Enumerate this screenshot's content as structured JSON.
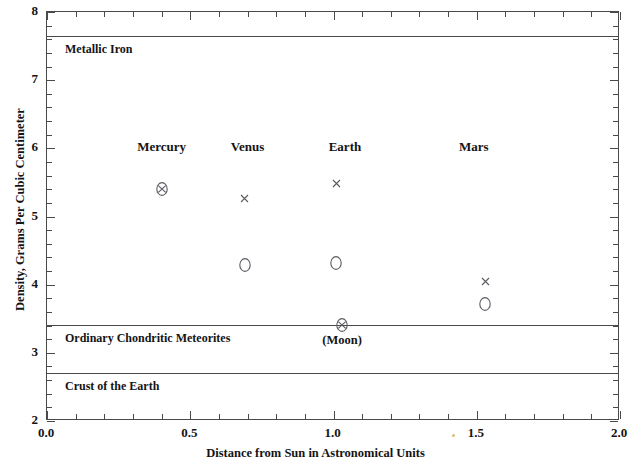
{
  "chart_data": {
    "type": "scatter",
    "title": "",
    "xlabel": "Distance from Sun in Astronomical Units",
    "ylabel": "Density, Grams Per Cubic Centimeter",
    "xlim": [
      0.0,
      2.0
    ],
    "ylim": [
      2,
      8
    ],
    "grid": false,
    "legend_position": "none",
    "x_ticks": [
      "0.0",
      "0.5",
      "1.0",
      "1.5",
      "2.0"
    ],
    "x_tick_values": [
      0.0,
      0.5,
      1.0,
      1.5,
      2.0
    ],
    "x_minor_step": 0.1,
    "y_ticks": [
      "2",
      "3",
      "4",
      "5",
      "6",
      "7",
      "8"
    ],
    "y_tick_values": [
      2,
      3,
      4,
      5,
      6,
      7,
      8
    ],
    "y_minor_step": 0.2,
    "series": [
      {
        "name": "Uncompressed density",
        "marker": "open-circle",
        "points": [
          {
            "label": "Venus",
            "x": 0.69,
            "y": 4.29
          },
          {
            "label": "Earth",
            "x": 1.01,
            "y": 4.32
          },
          {
            "label": "Mars",
            "x": 1.53,
            "y": 3.72
          }
        ]
      },
      {
        "name": "Observed mean density",
        "marker": "x",
        "points": [
          {
            "label": "Venus",
            "x": 0.69,
            "y": 5.27
          },
          {
            "label": "Earth",
            "x": 1.01,
            "y": 5.49
          },
          {
            "label": "Mars",
            "x": 1.53,
            "y": 4.04
          }
        ]
      },
      {
        "name": "Coincident observed and uncompressed density",
        "marker": "circled-x",
        "points": [
          {
            "label": "Mercury",
            "x": 0.4,
            "y": 5.41
          },
          {
            "label": "Moon",
            "x": 1.03,
            "y": 3.41
          }
        ]
      }
    ],
    "reference_lines": [
      {
        "label": "Metallic Iron",
        "y": 7.65
      },
      {
        "label": "Ordinary Chondritic Meteorites",
        "y": 3.41
      },
      {
        "label": "Crust of the Earth",
        "y": 2.7
      }
    ],
    "point_labels": [
      {
        "text": "Mercury",
        "x": 0.4,
        "y": 6.02
      },
      {
        "text": "Venus",
        "x": 0.7,
        "y": 6.02
      },
      {
        "text": "Earth",
        "x": 1.04,
        "y": 6.02
      },
      {
        "text": "Mars",
        "x": 1.49,
        "y": 6.02
      },
      {
        "text": "(Moon)",
        "x": 1.03,
        "y": 3.17
      }
    ]
  }
}
